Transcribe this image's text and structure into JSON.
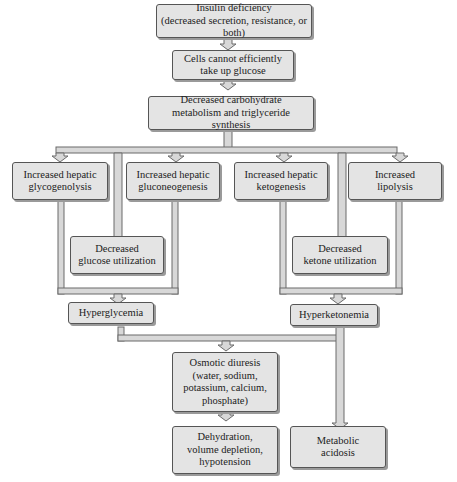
{
  "diagram": {
    "nodes": {
      "insulin": [
        "Insulin deficiency",
        "(decreased secretion, resistance, or both)"
      ],
      "cells": [
        "Cells cannot efficiently",
        "take up glucose"
      ],
      "carb": [
        "Decreased carbohydrate",
        "metabolism and triglyceride synthesis"
      ],
      "glycogenolysis": [
        "Increased hepatic",
        "glycogenolysis"
      ],
      "gluconeogenesis": [
        "Increased hepatic",
        "gluconeogenesis"
      ],
      "ketogenesis": [
        "Increased hepatic",
        "ketogenesis"
      ],
      "lipolysis": [
        "Increased",
        "lipolysis"
      ],
      "glucose_util": [
        "Decreased",
        "glucose utilization"
      ],
      "ketone_util": [
        "Decreased",
        "ketone utilization"
      ],
      "hyperglycemia": [
        "Hyperglycemia"
      ],
      "hyperketonemia": [
        "Hyperketonemia"
      ],
      "osmotic": [
        "Osmotic diuresis",
        "(water, sodium,",
        "potassium, calcium,",
        "phosphate)"
      ],
      "dehydration": [
        "Dehydration,",
        "volume depletion,",
        "hypotension"
      ],
      "acidosis": [
        "Metabolic",
        "acidosis"
      ]
    },
    "edges": [
      [
        "insulin",
        "cells"
      ],
      [
        "cells",
        "carb"
      ],
      [
        "carb",
        "glycogenolysis"
      ],
      [
        "carb",
        "gluconeogenesis"
      ],
      [
        "carb",
        "glucose_util"
      ],
      [
        "carb",
        "ketogenesis"
      ],
      [
        "carb",
        "ketone_util"
      ],
      [
        "carb",
        "lipolysis"
      ],
      [
        "glycogenolysis",
        "hyperglycemia"
      ],
      [
        "gluconeogenesis",
        "hyperglycemia"
      ],
      [
        "glucose_util",
        "hyperglycemia"
      ],
      [
        "ketogenesis",
        "hyperketonemia"
      ],
      [
        "lipolysis",
        "hyperketonemia"
      ],
      [
        "ketone_util",
        "hyperketonemia"
      ],
      [
        "hyperglycemia",
        "osmotic"
      ],
      [
        "hyperketonemia",
        "osmotic"
      ],
      [
        "osmotic",
        "dehydration"
      ],
      [
        "hyperketonemia",
        "acidosis"
      ]
    ],
    "colors": {
      "box_fill": "#e4e4e4",
      "box_border": "#555555",
      "connector_fill": "#d8d8d8",
      "connector_stroke": "#6a6a6a"
    }
  }
}
